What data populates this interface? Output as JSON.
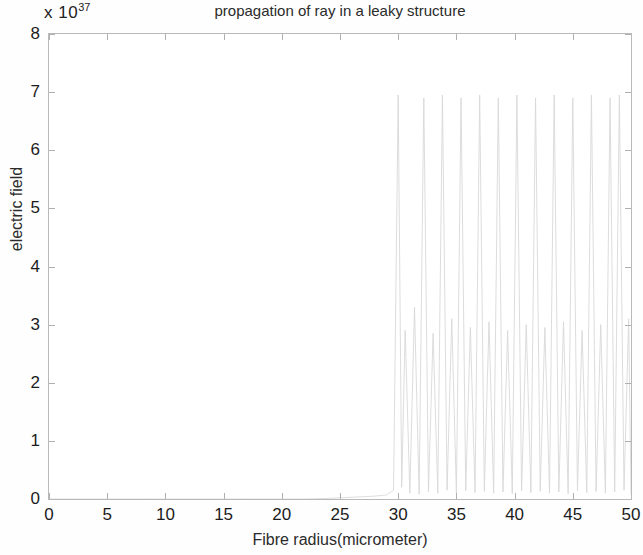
{
  "figure": {
    "title": "propagation of ray in a leaky structure",
    "exponent_prefix": "x 10",
    "exponent_power": "37",
    "background_color": "#ffffff",
    "axis_color": "#b9b9b9",
    "trace_color": "#d8d8d8"
  },
  "axes": {
    "x_title": "Fibre radius(micrometer)",
    "y_title": "electric field",
    "x_ticks": [
      "0",
      "5",
      "10",
      "15",
      "20",
      "25",
      "30",
      "35",
      "40",
      "45",
      "50"
    ],
    "y_ticks": [
      "0",
      "1",
      "2",
      "3",
      "4",
      "5",
      "6",
      "7",
      "8"
    ]
  },
  "chart_data": {
    "type": "line",
    "title": "propagation of ray in a leaky structure",
    "xlabel": "Fibre radius(micrometer)",
    "ylabel": "electric field",
    "y_scale_exponent": 37,
    "y_scale_label": "x 10^37",
    "xlim": [
      0,
      50
    ],
    "ylim": [
      0,
      8
    ],
    "xticks": [
      0,
      5,
      10,
      15,
      20,
      25,
      30,
      35,
      40,
      45,
      50
    ],
    "yticks": [
      0,
      1,
      2,
      3,
      4,
      5,
      6,
      7,
      8
    ],
    "grid": false,
    "legend": null,
    "series": [
      {
        "name": "electric field",
        "color": "#d8d8d8",
        "description": "near-zero baseline until x~30, then rapidly oscillating envelope rising to ~7e37 peaks between x=30 and x=50",
        "x": [
          0,
          2,
          4,
          6,
          8,
          10,
          12,
          14,
          16,
          18,
          20,
          22,
          24,
          25,
          26,
          27,
          28,
          29,
          29.6,
          30.0,
          30.3,
          30.6,
          31.0,
          31.4,
          31.8,
          32.2,
          32.6,
          33.0,
          33.4,
          33.8,
          34.2,
          34.6,
          35.0,
          35.4,
          35.8,
          36.2,
          36.6,
          37.0,
          37.4,
          37.8,
          38.2,
          38.6,
          39.0,
          39.4,
          39.8,
          40.2,
          40.6,
          41.0,
          41.4,
          41.8,
          42.2,
          42.6,
          43.0,
          43.4,
          43.8,
          44.2,
          44.6,
          45.0,
          45.4,
          45.8,
          46.2,
          46.6,
          47.0,
          47.4,
          47.8,
          48.2,
          48.6,
          49.0,
          49.4,
          49.8,
          50.0
        ],
        "y": [
          0,
          0,
          0,
          0,
          0,
          0,
          0,
          0,
          0,
          0,
          0,
          0,
          0.01,
          0.02,
          0.03,
          0.04,
          0.05,
          0.07,
          0.15,
          6.95,
          0.2,
          2.9,
          0.1,
          3.3,
          0.08,
          6.9,
          0.12,
          2.85,
          0.1,
          6.95,
          0.15,
          3.1,
          0.09,
          6.9,
          0.14,
          2.95,
          0.11,
          6.95,
          0.13,
          3.05,
          0.1,
          6.9,
          0.12,
          2.9,
          0.09,
          6.95,
          0.14,
          3.0,
          0.11,
          6.9,
          0.13,
          2.95,
          0.1,
          6.95,
          0.12,
          3.05,
          0.09,
          6.9,
          0.14,
          2.9,
          0.11,
          6.95,
          0.13,
          3.0,
          0.1,
          6.9,
          0.12,
          6.95,
          0.15,
          3.1,
          0.08
        ]
      }
    ],
    "annotations": [
      {
        "text": "oscillatory leaky-mode region",
        "x_range": [
          30,
          50
        ],
        "peak_value": 7.0
      }
    ]
  }
}
